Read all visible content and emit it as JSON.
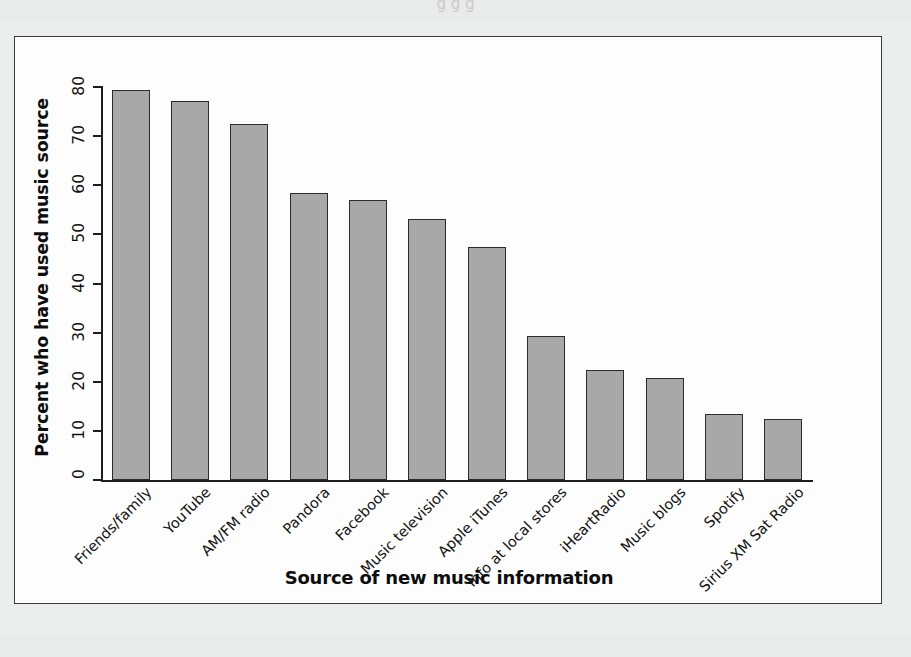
{
  "figure": {
    "background_color": "#eceded",
    "card_color": "#fdfdfd",
    "frame_color": "#3a3a3a",
    "bar_fill": "#a8a8a8",
    "bar_border": "#2b2b2b",
    "cut_off_text_above": "g g g"
  },
  "chart_data": {
    "type": "bar",
    "title": "",
    "xlabel": "Source of new music information",
    "ylabel": "Percent who have used music source",
    "ylim": [
      0,
      80
    ],
    "yticks": [
      0,
      10,
      20,
      30,
      40,
      50,
      60,
      70,
      80
    ],
    "grid": false,
    "legend": null,
    "categories": [
      "Friends/family",
      "YouTube",
      "AM/FM radio",
      "Pandora",
      "Facebook",
      "Music television",
      "Apple iTunes",
      "Info at local stores",
      "iHeartRadio",
      "Music blogs",
      "Spotify",
      "Sirius XM Sat Radio"
    ],
    "values": [
      79.3,
      77.1,
      72.4,
      58.4,
      57.1,
      53.2,
      47.4,
      29.3,
      22.4,
      20.7,
      13.4,
      12.4
    ]
  }
}
